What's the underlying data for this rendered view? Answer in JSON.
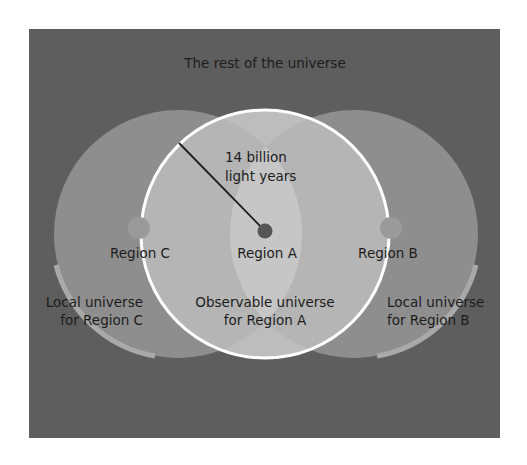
{
  "title": "The rest of the universe",
  "radius_label": [
    "14 billion",
    "light years"
  ],
  "regions": {
    "a": {
      "label": "Region A",
      "caption": [
        "Observable universe",
        "for Region A"
      ]
    },
    "b": {
      "label": "Region B",
      "caption": [
        "Local universe",
        "for Region B"
      ]
    },
    "c": {
      "label": "Region C",
      "caption": [
        "Local universe",
        "for Region C"
      ]
    }
  },
  "colors": {
    "background": "#5e5e5e",
    "side_circle": "#8e8e8e",
    "side_overlap": "#a4a4a4",
    "observable_circle": "#bdbdbd",
    "observable_center": "#c8c8c8",
    "rim": "#a9a9a9",
    "circle_outline": "#ffffff",
    "dot_a": "#555555",
    "dot_side": "#9a9a9a",
    "text": "#1c1c1c"
  }
}
